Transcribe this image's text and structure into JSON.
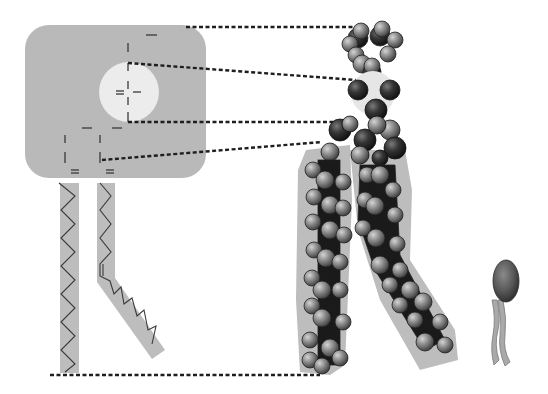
{
  "figure": {
    "panels": [
      {
        "id": "structural-formula",
        "description": "structural formula with hydrophilic head region (gray box) and two hydrocarbon tails (straight and kinked)"
      },
      {
        "id": "space-filling-model",
        "description": "space-filling model with dark head-group atoms and gray tail atoms"
      },
      {
        "id": "symbol",
        "description": "phospholipid symbol: oval head with two wavy tails"
      }
    ]
  },
  "colors": {
    "background": "#ffffff",
    "head_box": "#b9b9b9",
    "head_circle": "#ececec",
    "tail_band": "#bdbdbd",
    "bond_line": "#3a3a3a",
    "dotted_line": "#1e1e1e",
    "atom_dark": "#2c2c2c",
    "atom_gray": "#8a8a8a",
    "atom_light": "#a6a6a6",
    "symbol_head": "#5a5a5a",
    "symbol_tail": "#a9a9a9"
  },
  "connector_lines": [
    {
      "x1": 186,
      "y1": 27,
      "x2": 362,
      "y2": 27
    },
    {
      "x1": 128,
      "y1": 63,
      "x2": 356,
      "y2": 80
    },
    {
      "x1": 128,
      "y1": 122,
      "x2": 352,
      "y2": 122
    },
    {
      "x1": 102,
      "y1": 160,
      "x2": 322,
      "y2": 142
    },
    {
      "x1": 50,
      "y1": 375,
      "x2": 320,
      "y2": 375
    }
  ]
}
